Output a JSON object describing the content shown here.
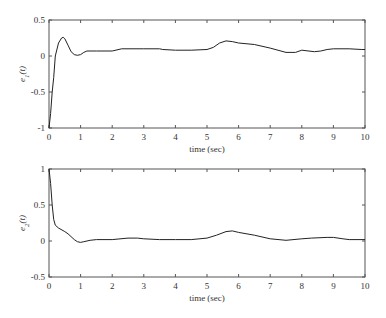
{
  "chart_data": [
    {
      "type": "line",
      "title": "",
      "xlabel": "time (sec)",
      "ylabel": "e1(t)",
      "ylabel_main": "e",
      "ylabel_sub": "1",
      "ylabel_arg": "(t)",
      "xlim": [
        0,
        10
      ],
      "ylim": [
        -1,
        0.5
      ],
      "xticks": [
        "0",
        "1",
        "2",
        "3",
        "4",
        "5",
        "6",
        "7",
        "8",
        "9",
        "10"
      ],
      "yticks": [
        "0.5",
        "0",
        "-0.5",
        "-1"
      ],
      "grid": false,
      "series": [
        {
          "name": "e1(t)",
          "x": [
            0,
            0.05,
            0.1,
            0.15,
            0.2,
            0.3,
            0.4,
            0.45,
            0.5,
            0.6,
            0.7,
            0.8,
            0.9,
            1.0,
            1.1,
            1.2,
            1.5,
            2.0,
            2.3,
            3.0,
            3.5,
            3.6,
            4.0,
            4.5,
            5.0,
            5.2,
            5.4,
            5.6,
            5.8,
            6.0,
            6.5,
            7.0,
            7.5,
            7.8,
            8.0,
            8.4,
            8.6,
            8.8,
            9.0,
            9.5,
            9.9,
            10.0
          ],
          "y": [
            -1.0,
            -0.8,
            -0.5,
            -0.3,
            0.0,
            0.18,
            0.25,
            0.26,
            0.24,
            0.15,
            0.06,
            0.02,
            0.01,
            0.02,
            0.05,
            0.07,
            0.07,
            0.07,
            0.1,
            0.1,
            0.1,
            0.09,
            0.08,
            0.08,
            0.09,
            0.12,
            0.18,
            0.21,
            0.2,
            0.18,
            0.16,
            0.11,
            0.05,
            0.05,
            0.08,
            0.06,
            0.07,
            0.09,
            0.1,
            0.1,
            0.09,
            0.09
          ]
        }
      ]
    },
    {
      "type": "line",
      "title": "",
      "xlabel": "time (sec)",
      "ylabel": "e2(t)",
      "ylabel_main": "e",
      "ylabel_sub": "2",
      "ylabel_arg": "(t)",
      "xlim": [
        0,
        10
      ],
      "ylim": [
        -0.5,
        1
      ],
      "xticks": [
        "0",
        "1",
        "2",
        "3",
        "4",
        "5",
        "6",
        "7",
        "8",
        "9",
        "10"
      ],
      "yticks": [
        "1",
        "0.5",
        "0",
        "-0.5"
      ],
      "grid": false,
      "series": [
        {
          "name": "e2(t)",
          "x": [
            0,
            0.05,
            0.1,
            0.15,
            0.2,
            0.3,
            0.5,
            0.6,
            0.8,
            0.9,
            1.0,
            1.1,
            1.3,
            1.5,
            2.0,
            2.5,
            2.8,
            3.0,
            3.5,
            4.0,
            4.5,
            5.0,
            5.3,
            5.6,
            5.8,
            6.0,
            6.5,
            7.0,
            7.5,
            8.0,
            8.3,
            8.8,
            9.0,
            9.3,
            9.5,
            10.0
          ],
          "y": [
            1.0,
            0.8,
            0.5,
            0.3,
            0.22,
            0.18,
            0.13,
            0.1,
            0.02,
            -0.01,
            -0.02,
            -0.01,
            0.01,
            0.02,
            0.02,
            0.04,
            0.04,
            0.03,
            0.02,
            0.02,
            0.02,
            0.04,
            0.08,
            0.13,
            0.14,
            0.12,
            0.08,
            0.03,
            0.01,
            0.03,
            0.04,
            0.05,
            0.05,
            0.03,
            0.02,
            0.02
          ]
        }
      ]
    }
  ],
  "plots": [
    {
      "ylabel_main": "e",
      "ylabel_sub": "1",
      "ylabel_arg": "(t)",
      "xlabel": "time (sec)",
      "yticks": [
        "0.5",
        "0",
        "-0.5",
        "-1"
      ],
      "xticks": [
        "0",
        "1",
        "2",
        "3",
        "4",
        "5",
        "6",
        "7",
        "8",
        "9",
        "10"
      ]
    },
    {
      "ylabel_main": "e",
      "ylabel_sub": "2",
      "ylabel_arg": "(t)",
      "xlabel": "time (sec)",
      "yticks": [
        "1",
        "0.5",
        "0",
        "-0.5"
      ],
      "xticks": [
        "0",
        "1",
        "2",
        "3",
        "4",
        "5",
        "6",
        "7",
        "8",
        "9",
        "10"
      ]
    }
  ]
}
